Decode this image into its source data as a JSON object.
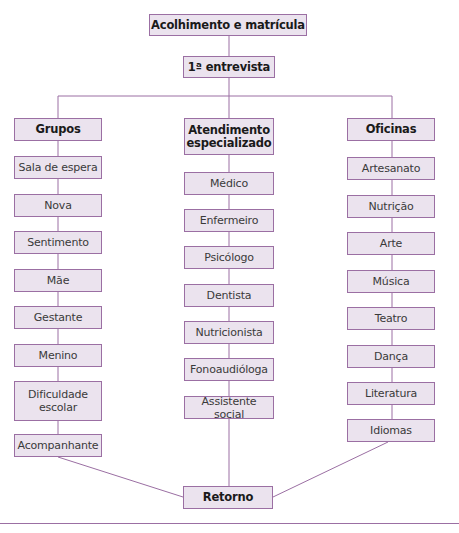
{
  "diagram": {
    "top": "Acolhimento e matrícula",
    "interview": "1ª entrevista",
    "columns": [
      {
        "header": "Grupos",
        "items": [
          "Sala de espera",
          "Nova",
          "Sentimento",
          "Mãe",
          "Gestante",
          "Menino",
          "Dificuldade escolar",
          "Acompanhante"
        ]
      },
      {
        "header": "Atendimento especializado",
        "items": [
          "Médico",
          "Enfermeiro",
          "Psicólogo",
          "Dentista",
          "Nutricionista",
          "Fonoaudióloga",
          "Assistente social"
        ]
      },
      {
        "header": "Oficinas",
        "items": [
          "Artesanato",
          "Nutrição",
          "Arte",
          "Música",
          "Teatro",
          "Dança",
          "Literatura",
          "Idiomas"
        ]
      }
    ],
    "bottom": "Retorno",
    "colors": {
      "box_fill": "#ebe3ee",
      "line": "#9b6fa3"
    }
  }
}
